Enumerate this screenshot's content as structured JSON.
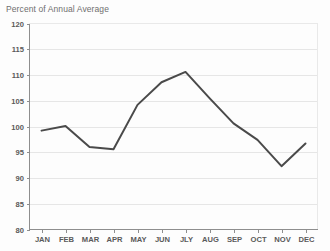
{
  "chart_data": {
    "type": "line",
    "title": "Percent of Annual Average",
    "xlabel": "",
    "ylabel": "",
    "categories": [
      "JAN",
      "FEB",
      "MAR",
      "APR",
      "MAY",
      "JUN",
      "JLY",
      "AUG",
      "SEP",
      "OCT",
      "NOV",
      "DEC"
    ],
    "values": [
      99.2,
      100.1,
      96.0,
      95.6,
      104.2,
      108.6,
      110.6,
      105.5,
      100.6,
      97.4,
      92.3,
      96.7
    ],
    "series": [
      {
        "name": "Percent of Annual Average",
        "values": [
          99.2,
          100.1,
          96.0,
          95.6,
          104.2,
          108.6,
          110.6,
          105.5,
          100.6,
          97.4,
          92.3,
          96.7
        ]
      }
    ],
    "ylim": [
      80,
      120
    ],
    "yticks": [
      80,
      85,
      90,
      95,
      100,
      105,
      110,
      115,
      120
    ],
    "ytick_labels": [
      "80",
      "85",
      "90",
      "95",
      "100",
      "105",
      "110",
      "115",
      "120"
    ],
    "grid": true,
    "grid_axis": "y",
    "legend": false,
    "legend_position": "none",
    "line_color": "#4a4a4a",
    "grid_color": "#e6e6e6",
    "axis_color": "#8e8e8e",
    "tick_label_color": "#5a5a5a",
    "title_color": "#6f6f6f",
    "background_color": "#fdfdfd"
  }
}
